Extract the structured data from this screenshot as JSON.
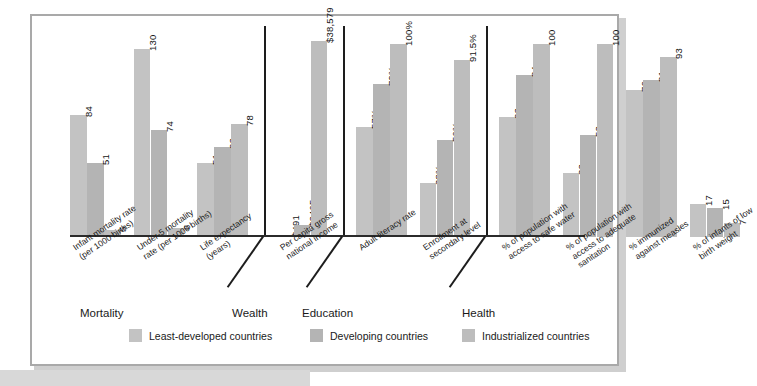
{
  "chart_data": {
    "type": "bar",
    "title": "",
    "xlabel": "",
    "ylabel": "",
    "grid": false,
    "legend_position": "bottom",
    "series": [
      {
        "name": "Least-developed countries",
        "color": "#c3c3c3"
      },
      {
        "name": "Developing countries",
        "color": "#b4b4b4"
      },
      {
        "name": "Industrialized countries",
        "color": "#bdbdbd"
      }
    ],
    "groups": [
      {
        "name": "Mortality",
        "categories": [
          {
            "label": "Infant mortality rate\n(per 1000 births)",
            "values": [
              84,
              51,
              5
            ],
            "value_labels": [
              "84",
              "51",
              "5"
            ]
          },
          {
            "label": "Under-5 mortality\nrate (per 1000 births)",
            "values": [
              130,
              74,
              6
            ],
            "value_labels": [
              "130",
              "74",
              "6"
            ]
          },
          {
            "label": "Life expectancy\n(years)",
            "values": [
              51,
              62,
              78
            ],
            "value_labels": [
              "51",
              "62",
              "78"
            ]
          }
        ]
      },
      {
        "name": "Wealth",
        "categories": [
          {
            "label": "Per capita gross\nnational income",
            "values": [
              491,
              2405,
              38579
            ],
            "value_labels": [
              "$491",
              "$2405",
              "$38,579"
            ]
          }
        ]
      },
      {
        "name": "Education",
        "categories": [
          {
            "label": "Adult literacy rate",
            "values": [
              57,
              79,
              100
            ],
            "value_labels": [
              "57%",
              "79%",
              "100%"
            ]
          },
          {
            "label": "Enrollment at\nsecondary level",
            "values": [
              28,
              50,
              91.5
            ],
            "value_labels": [
              "28%",
              "50%",
              "91.5%"
            ]
          }
        ]
      },
      {
        "name": "Health",
        "categories": [
          {
            "label": "% of population with\naccess to safe water",
            "values": [
              62,
              84,
              100
            ],
            "value_labels": [
              "62",
              "84",
              "100"
            ]
          },
          {
            "label": "% of population with\naccess to adequate\nsanitation",
            "values": [
              33,
              53,
              100
            ],
            "value_labels": [
              "33",
              "53",
              "100"
            ]
          },
          {
            "label": "% immunized\nagainst measles",
            "values": [
              76,
              81,
              93
            ],
            "value_labels": [
              "76",
              "81",
              "93"
            ]
          },
          {
            "label": "% of infants of low\nbirth weight",
            "values": [
              17,
              15,
              7
            ],
            "value_labels": [
              "17",
              "15",
              "7"
            ]
          }
        ]
      }
    ]
  },
  "legend": {
    "items": [
      {
        "label": "Least-developed countries",
        "color": "#c3c3c3"
      },
      {
        "label": "Developing countries",
        "color": "#b4b4b4"
      },
      {
        "label": "Industrialized countries",
        "color": "#bdbdbd"
      }
    ]
  },
  "group_labels": [
    "Mortality",
    "Wealth",
    "Education",
    "Health"
  ],
  "colors": {
    "frame": "#a9a9a9",
    "axis": "#2b2b2b",
    "text": "#1a1a1a",
    "background": "#ffffff"
  }
}
